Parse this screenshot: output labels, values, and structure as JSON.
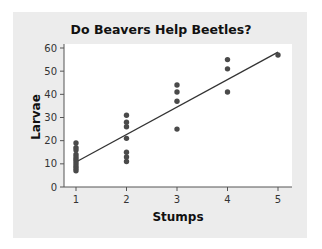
{
  "chart_data": {
    "type": "scatter",
    "title": "Do Beavers Help Beetles?",
    "xlabel": "Stumps",
    "ylabel": "Larvae",
    "xlim": [
      0.75,
      5.3
    ],
    "ylim": [
      0,
      60
    ],
    "xticks": [
      1,
      2,
      3,
      4,
      5
    ],
    "yticks": [
      0,
      10,
      20,
      30,
      40,
      50,
      60
    ],
    "grid": false,
    "legend": null,
    "series": [
      {
        "name": "observations",
        "points": [
          {
            "x": 1,
            "y": 7
          },
          {
            "x": 1,
            "y": 8
          },
          {
            "x": 1,
            "y": 9
          },
          {
            "x": 1,
            "y": 10
          },
          {
            "x": 1,
            "y": 11
          },
          {
            "x": 1,
            "y": 12
          },
          {
            "x": 1,
            "y": 13
          },
          {
            "x": 1,
            "y": 14
          },
          {
            "x": 1,
            "y": 16
          },
          {
            "x": 1,
            "y": 17
          },
          {
            "x": 1,
            "y": 19
          },
          {
            "x": 2,
            "y": 11
          },
          {
            "x": 2,
            "y": 13
          },
          {
            "x": 2,
            "y": 15
          },
          {
            "x": 2,
            "y": 21
          },
          {
            "x": 2,
            "y": 26
          },
          {
            "x": 2,
            "y": 28
          },
          {
            "x": 2,
            "y": 31
          },
          {
            "x": 3,
            "y": 25
          },
          {
            "x": 3,
            "y": 37
          },
          {
            "x": 3,
            "y": 41
          },
          {
            "x": 3,
            "y": 44
          },
          {
            "x": 4,
            "y": 41
          },
          {
            "x": 4,
            "y": 51
          },
          {
            "x": 4,
            "y": 55
          },
          {
            "x": 5,
            "y": 57
          }
        ]
      }
    ],
    "trendline": {
      "type": "linear",
      "x": [
        1,
        5
      ],
      "y": [
        10.8,
        58.2
      ]
    },
    "colors": {
      "point": "#4a4a4a",
      "line": "#333333",
      "panel": "#ececec",
      "plot": "#ffffff"
    }
  }
}
